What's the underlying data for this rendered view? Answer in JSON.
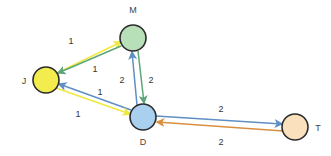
{
  "diagram": {
    "background_color": "#ffffff",
    "node_stroke_color": "#2b2b2b",
    "nodes": [
      {
        "id": "M",
        "label": "M",
        "cx": 133,
        "cy": 38,
        "r": 13,
        "fill": "#b8e0b8",
        "label_x": 133,
        "label_y": 13,
        "label_anchor": "middle"
      },
      {
        "id": "J",
        "label": "J",
        "cx": 46,
        "cy": 80,
        "r": 13,
        "fill": "#f2ec4c",
        "label_x": 24,
        "label_y": 84,
        "label_anchor": "middle"
      },
      {
        "id": "D",
        "label": "D",
        "cx": 143,
        "cy": 117,
        "r": 13,
        "fill": "#a9d0ef",
        "label_x": 143,
        "label_y": 145,
        "label_anchor": "middle"
      },
      {
        "id": "T",
        "label": "T",
        "cx": 295,
        "cy": 127,
        "r": 13,
        "fill": "#fae0bd",
        "label_x": 318,
        "label_y": 131,
        "label_anchor": "middle"
      }
    ],
    "edges": [
      {
        "id": "J-M",
        "from": "J",
        "to": "M",
        "weight": "1",
        "color": "#efe93f",
        "x1": 57,
        "y1": 73,
        "x2": 121,
        "y2": 42,
        "label_x": 71,
        "label_y": 44
      },
      {
        "id": "M-J",
        "from": "M",
        "to": "J",
        "weight": "1",
        "color": "#5ca679",
        "x1": 121,
        "y1": 46,
        "x2": 58,
        "y2": 73,
        "label_x": 95,
        "label_y": 72
      },
      {
        "id": "D-M",
        "from": "D",
        "to": "M",
        "weight": "2",
        "color": "#5f8fc4",
        "x1": 137,
        "y1": 105,
        "x2": 132,
        "y2": 52,
        "label_x": 122,
        "label_y": 83
      },
      {
        "id": "M-D",
        "from": "M",
        "to": "D",
        "weight": "2",
        "color": "#5ca679",
        "x1": 138,
        "y1": 51,
        "x2": 144,
        "y2": 103,
        "label_x": 151,
        "label_y": 83
      },
      {
        "id": "D-J",
        "from": "D",
        "to": "J",
        "weight": "1",
        "color": "#5f8fc4",
        "x1": 131,
        "y1": 110,
        "x2": 59,
        "y2": 84,
        "label_x": 100,
        "label_y": 95
      },
      {
        "id": "J-D",
        "from": "J",
        "to": "D",
        "weight": "1",
        "color": "#efe93f",
        "x1": 56,
        "y1": 88,
        "x2": 130,
        "y2": 114,
        "label_x": 78,
        "label_y": 117
      },
      {
        "id": "D-T",
        "from": "D",
        "to": "T",
        "weight": "2",
        "color": "#5f8fc4",
        "x1": 156,
        "y1": 116,
        "x2": 282,
        "y2": 124,
        "label_x": 221,
        "label_y": 112
      },
      {
        "id": "T-D",
        "from": "T",
        "to": "D",
        "weight": "2",
        "color": "#d98f3f",
        "x1": 283,
        "y1": 131,
        "x2": 157,
        "y2": 122,
        "label_x": 221,
        "label_y": 145
      }
    ]
  }
}
